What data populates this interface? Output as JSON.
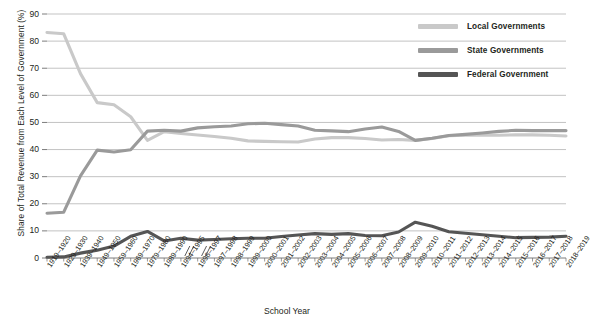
{
  "chart_data": {
    "type": "line",
    "title": "",
    "xlabel": "School Year",
    "ylabel": "Share of Total Revenue from Each Level of Government (%)",
    "ylim": [
      0,
      90
    ],
    "ytick_labels": [
      "0",
      "10",
      "20",
      "30",
      "40",
      "50",
      "60",
      "70",
      "80",
      "90"
    ],
    "grid": true,
    "legend_position": "top-right",
    "axis_breaks": [
      9,
      10
    ],
    "categories": [
      "1919–1920",
      "1929–1930",
      "1939–1940",
      "1949–1950",
      "1959–1960",
      "1969–1970",
      "1979–1980",
      "1989–1990",
      "1994–1995",
      "1996–1997",
      "1997–1998",
      "1998–1999",
      "1999–2000",
      "2000–2001",
      "2001–2002",
      "2002–2003",
      "2003–2004",
      "2004–2005",
      "2005–2006",
      "2006–2007",
      "2007–2008",
      "2008–2009",
      "2009–2010",
      "2010–2011",
      "2011–2012",
      "2012–2013",
      "2013–2014",
      "2014–2015",
      "2015–2016",
      "2016–2017",
      "2017–2018",
      "2018–2019"
    ],
    "series": [
      {
        "name": "Local Governments",
        "color": "#c9c9c9",
        "values": [
          83.2,
          82.7,
          68.0,
          57.3,
          56.5,
          52.1,
          43.4,
          46.6,
          45.9,
          45.4,
          44.8,
          44.2,
          43.2,
          43.0,
          42.9,
          42.8,
          43.9,
          44.4,
          44.4,
          44.1,
          43.5,
          43.7,
          43.4,
          44.1,
          45.1,
          45.3,
          45.3,
          45.3,
          45.4,
          45.4,
          45.3,
          45.0
        ]
      },
      {
        "name": "State Governments",
        "color": "#9a9a9a",
        "values": [
          16.5,
          16.9,
          30.3,
          39.8,
          39.1,
          39.9,
          46.8,
          47.1,
          46.8,
          48.0,
          48.4,
          48.7,
          49.5,
          49.7,
          49.2,
          48.7,
          47.1,
          46.9,
          46.6,
          47.6,
          48.3,
          46.7,
          43.4,
          44.2,
          45.2,
          45.6,
          46.1,
          46.7,
          47.1,
          47.0,
          47.0,
          47.0
        ]
      },
      {
        "name": "Federal Government",
        "color": "#555555",
        "values": [
          0.3,
          0.4,
          1.8,
          2.9,
          4.4,
          8.0,
          9.8,
          6.3,
          7.3,
          6.6,
          6.8,
          7.1,
          7.3,
          7.3,
          7.9,
          8.5,
          9.0,
          8.7,
          9.0,
          8.3,
          8.2,
          9.6,
          13.2,
          11.7,
          9.7,
          9.1,
          8.6,
          8.0,
          7.5,
          7.6,
          7.7,
          8.0
        ]
      }
    ]
  },
  "legend": {
    "items": [
      {
        "label": "Local Governments",
        "color": "#c9c9c9"
      },
      {
        "label": "State Governments",
        "color": "#9a9a9a"
      },
      {
        "label": "Federal Government",
        "color": "#555555"
      }
    ]
  }
}
